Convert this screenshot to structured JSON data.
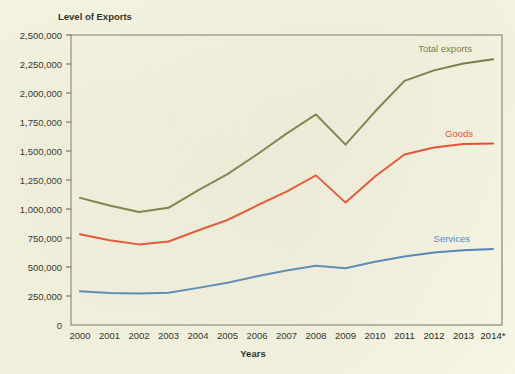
{
  "figure": {
    "y_axis_title": "Level of Exports",
    "x_axis_title": "Years",
    "background_color": "#f7f6e4"
  },
  "labels": {
    "total_exports": "Total exports",
    "goods": "Goods",
    "services": "Services"
  },
  "chart_data": {
    "type": "line",
    "title": "Level of Exports",
    "xlabel": "Years",
    "ylabel": "Level of Exports",
    "ylim": [
      0,
      2500000
    ],
    "xlim": [
      "2000",
      "2014*"
    ],
    "grid": false,
    "legend_position": "inline-right",
    "categories": [
      "2000",
      "2001",
      "2002",
      "2003",
      "2004",
      "2005",
      "2006",
      "2007",
      "2008",
      "2009",
      "2010",
      "2011",
      "2012",
      "2013",
      "2014*"
    ],
    "ytick_labels": [
      "0",
      "250,000",
      "500,000",
      "750,000",
      "1,000,000",
      "1,250,000",
      "1,500,000",
      "1,750,000",
      "2,000,000",
      "2,250,000",
      "2,500,000"
    ],
    "ytick_values": [
      0,
      250000,
      500000,
      750000,
      1000000,
      1250000,
      1500000,
      1750000,
      2000000,
      2250000,
      2500000
    ],
    "series": [
      {
        "name": "Total exports",
        "color": "#6b7336",
        "values": [
          1096000,
          1030000,
          975000,
          1010000,
          1160000,
          1300000,
          1470000,
          1650000,
          1815000,
          1555000,
          1840000,
          2105000,
          2195000,
          2255000,
          2290000
        ]
      },
      {
        "name": "Goods",
        "color": "#e8401f",
        "values": [
          782000,
          730000,
          695000,
          720000,
          815000,
          905000,
          1030000,
          1150000,
          1290000,
          1055000,
          1280000,
          1470000,
          1530000,
          1560000,
          1565000
        ]
      },
      {
        "name": "Services",
        "color": "#4a7fba",
        "values": [
          290000,
          275000,
          272000,
          278000,
          320000,
          365000,
          420000,
          470000,
          510000,
          490000,
          545000,
          590000,
          625000,
          645000,
          655000
        ]
      }
    ]
  }
}
